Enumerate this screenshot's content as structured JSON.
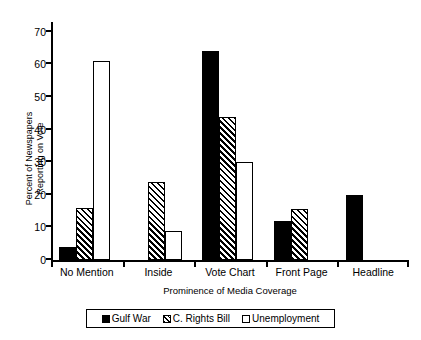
{
  "chart_data": {
    "type": "bar",
    "title": "",
    "xlabel": "Prominence of Media Coverage",
    "ylabel": "Percent of Newspapers\nReporting on Vote",
    "categories": [
      "No Mention",
      "Inside",
      "Vote Chart",
      "Front Page",
      "Headline"
    ],
    "series": [
      {
        "name": "Gulf War",
        "values": [
          4,
          0,
          64,
          12,
          20
        ]
      },
      {
        "name": "C. Rights Bill",
        "values": [
          16,
          24,
          44,
          15.5,
          0
        ]
      },
      {
        "name": "Unemployment",
        "values": [
          61,
          9,
          30,
          0,
          0
        ]
      }
    ],
    "ylim": [
      0,
      73
    ],
    "y_ticks": [
      0,
      10,
      20,
      30,
      40,
      50,
      60,
      70
    ],
    "grid": false,
    "legend_position": "bottom",
    "series_styles": [
      "solid-black",
      "diagonal-hatch",
      "open-white"
    ]
  },
  "legend": {
    "entries": [
      {
        "label": "Gulf War",
        "swatch": "solid-black-swatch"
      },
      {
        "label": "C. Rights Bill",
        "swatch": "hatched-swatch"
      },
      {
        "label": "Unemployment",
        "swatch": "open-white-swatch"
      }
    ]
  },
  "colors": {
    "ink": "#000000",
    "background": "#ffffff"
  }
}
